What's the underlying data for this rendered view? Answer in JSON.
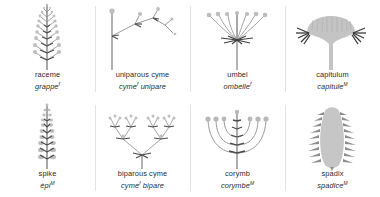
{
  "figure": {
    "background_color": "#ffffff",
    "stem_color": "#9a9a9a",
    "bud_color": "#b5b5b5",
    "dark_color": "#4a4a4a",
    "text_color": "#2b2b2b"
  },
  "panels": [
    {
      "id": "raceme",
      "en": "raceme",
      "fr": "grappe",
      "gender": "f",
      "diagram": "raceme"
    },
    {
      "id": "uniparous-cyme",
      "en": "uniparous cyme",
      "fr_1": "cyme",
      "gender": "f",
      "fr_2": "unipare",
      "diagram": "uniparous-cyme"
    },
    {
      "id": "umbel",
      "en": "umbel",
      "fr": "ombelle",
      "gender": "f",
      "diagram": "umbel"
    },
    {
      "id": "capitulum",
      "en": "capitulum",
      "fr": "capitule",
      "gender": "M",
      "diagram": "capitulum"
    },
    {
      "id": "spike",
      "en": "spike",
      "fr": "épi",
      "gender": "M",
      "diagram": "spike"
    },
    {
      "id": "biparous-cyme",
      "en": "biparous cyme",
      "fr_1": "cyme",
      "gender": "f",
      "fr_2": "bipare",
      "diagram": "biparous-cyme"
    },
    {
      "id": "corymb",
      "en": "corymb",
      "fr": "corymbe",
      "gender": "M",
      "diagram": "corymb"
    },
    {
      "id": "spadix",
      "en": "spadix",
      "fr": "spadice",
      "gender": "M",
      "diagram": "spadix"
    }
  ]
}
